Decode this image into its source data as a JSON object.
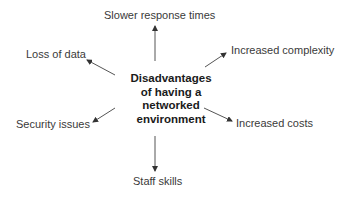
{
  "diagram": {
    "center": {
      "lines": [
        "Disadvantages",
        "of having a",
        "networked",
        "environment"
      ]
    },
    "nodes": [
      {
        "id": "top",
        "label": "Slower response times"
      },
      {
        "id": "top-left",
        "label": "Loss of data"
      },
      {
        "id": "top-right",
        "label": "Increased complexity"
      },
      {
        "id": "bottom-left",
        "label": "Security issues"
      },
      {
        "id": "bottom-right",
        "label": "Increased costs"
      },
      {
        "id": "bottom",
        "label": "Staff skills"
      }
    ],
    "colors": {
      "arrow": "#333333",
      "text": "#3a3a3a",
      "center_text": "#1a1a1a",
      "background": "#ffffff"
    }
  }
}
